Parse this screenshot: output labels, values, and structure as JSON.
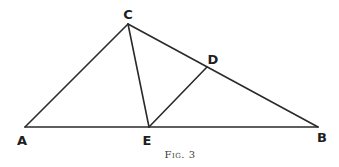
{
  "figure": {
    "caption": "Fig. 3",
    "points": {
      "A": {
        "label": "A",
        "x": 25,
        "y": 127,
        "lx": 22,
        "ly": 140
      },
      "B": {
        "label": "B",
        "x": 318,
        "y": 127,
        "lx": 322,
        "ly": 137
      },
      "C": {
        "label": "C",
        "x": 128,
        "y": 24,
        "lx": 128,
        "ly": 14
      },
      "D": {
        "label": "D",
        "x": 207,
        "y": 67,
        "lx": 213,
        "ly": 59
      },
      "E": {
        "label": "E",
        "x": 149,
        "y": 127,
        "lx": 147,
        "ly": 140
      }
    },
    "segments": [
      {
        "name": "segment-AC",
        "from": "A",
        "to": "C"
      },
      {
        "name": "segment-CB",
        "from": "C",
        "to": "B"
      },
      {
        "name": "segment-AB",
        "from": "A",
        "to": "B"
      },
      {
        "name": "segment-CE",
        "from": "C",
        "to": "E"
      },
      {
        "name": "segment-ED",
        "from": "E",
        "to": "D"
      }
    ]
  }
}
